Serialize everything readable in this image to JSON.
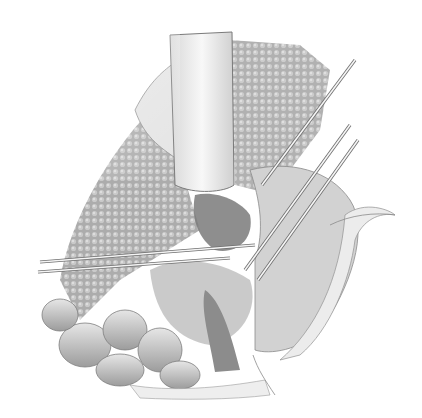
{
  "image": {
    "kind": "grayscale surgical illustration",
    "description": "Pencil-style medical illustration of an abdominal surgical field with retractors, instruments crossing the field, textured tissue on the left, and bowel loops at the bottom left",
    "width": 422,
    "height": 418,
    "palette": {
      "background": "#ffffff",
      "tissue_dark": "#8a8a8a",
      "tissue_mid": "#b4b4b4",
      "tissue_light": "#dedede",
      "retractor": "#f0f0f0",
      "outline": "#6a6a6a"
    }
  }
}
